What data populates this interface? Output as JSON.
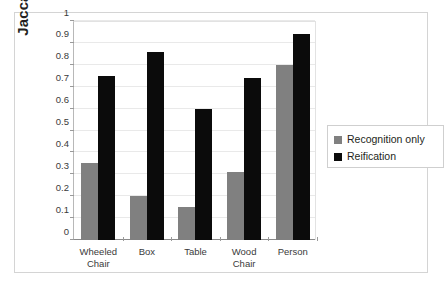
{
  "chart_data": {
    "type": "bar",
    "title": "",
    "xlabel": "",
    "ylabel": "Jaccard Index",
    "ylim": [
      0,
      1
    ],
    "yticks": [
      "0",
      "0.1",
      "0.2",
      "0.3",
      "0.4",
      "0.5",
      "0.6",
      "0.7",
      "0.8",
      "0.9",
      "1"
    ],
    "grid": true,
    "legend_position": "right",
    "categories": [
      "Wheeled Chair",
      "Box",
      "Table",
      "Wood Chair",
      "Person"
    ],
    "category_lines": [
      [
        "Wheeled",
        "Chair"
      ],
      [
        "Box",
        ""
      ],
      [
        "Table",
        ""
      ],
      [
        "Wood",
        "Chair"
      ],
      [
        "Person",
        ""
      ]
    ],
    "series": [
      {
        "name": "Recognition only",
        "color": "#808080",
        "values": [
          0.35,
          0.2,
          0.15,
          0.31,
          0.8
        ]
      },
      {
        "name": "Reification",
        "color": "#0b0b0b",
        "values": [
          0.75,
          0.86,
          0.6,
          0.74,
          0.94
        ]
      }
    ]
  },
  "legend": {
    "items": [
      {
        "label": "Recognition only",
        "swatch": "gray"
      },
      {
        "label": "Reification",
        "swatch": "black"
      }
    ]
  }
}
